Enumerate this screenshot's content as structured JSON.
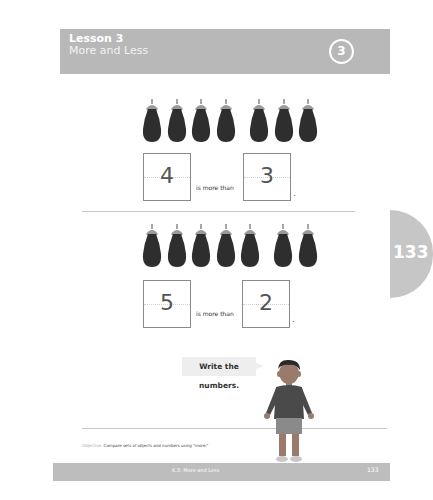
{
  "header": {
    "lesson": "Lesson 3",
    "title": "More and Less",
    "badge": "3",
    "band_color": "#b8b8b8"
  },
  "exercises": [
    {
      "group_a_count": 4,
      "group_b_count": 3,
      "answer_left": "4",
      "phrase": "is more than",
      "answer_right": "3",
      "period": "."
    },
    {
      "group_a_count": 5,
      "group_b_count": 2,
      "answer_left": "5",
      "phrase": "is more than",
      "answer_right": "2",
      "period": "."
    }
  ],
  "page_tab": {
    "number": "133"
  },
  "speech_bubble": {
    "text": "Write the numbers."
  },
  "objective": {
    "label": "Objective:",
    "text": "Compare sets of objects and numbers using \"more.\""
  },
  "footer": {
    "title": "K.3: More and Less",
    "page": "133"
  },
  "icons": {
    "object": "eggplant-icon",
    "character": "boy-figure"
  }
}
